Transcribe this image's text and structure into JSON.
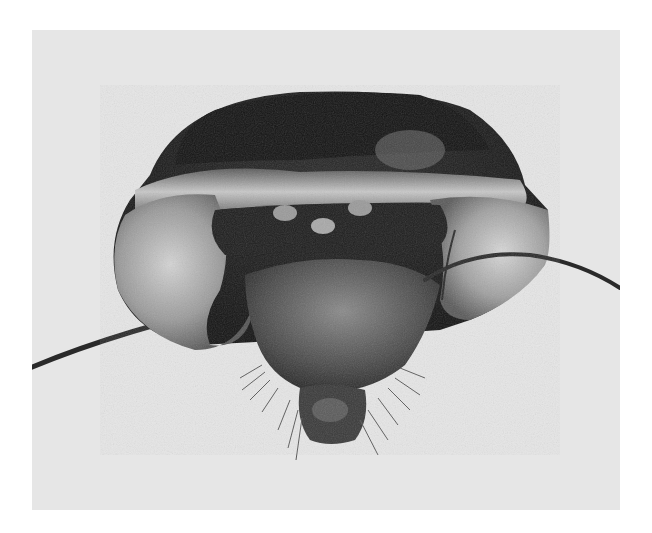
{
  "image": {
    "subject": "insect-head-frontal-view",
    "style": "grayscale-micrograph",
    "colors": {
      "frame": "#ffffff",
      "background": "#e6e6e6",
      "dark_cuticle": "#1e1e1e",
      "light_band": "#bdbdbd"
    }
  }
}
